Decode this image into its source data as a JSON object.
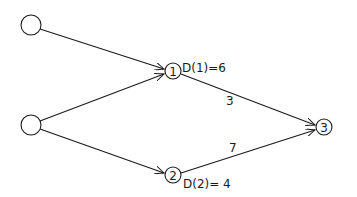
{
  "nodes": [
    {
      "id": "s1",
      "label": "",
      "x": 31,
      "y": 25,
      "r": 10
    },
    {
      "id": "s2",
      "label": "",
      "x": 31,
      "y": 125,
      "r": 10
    },
    {
      "id": "n1",
      "label": "1",
      "x": 173,
      "y": 71,
      "r": 8
    },
    {
      "id": "n2",
      "label": "2",
      "x": 173,
      "y": 175,
      "r": 8
    },
    {
      "id": "n3",
      "label": "3",
      "x": 324,
      "y": 127,
      "r": 8
    }
  ],
  "edges": [
    {
      "from": "s1",
      "to": "n1",
      "label": ""
    },
    {
      "from": "s2",
      "to": "n1",
      "label": ""
    },
    {
      "from": "s2",
      "to": "n2",
      "label": ""
    },
    {
      "from": "n1",
      "to": "n3",
      "label": "3"
    },
    {
      "from": "n2",
      "to": "n3",
      "label": "7"
    }
  ],
  "annotations": {
    "d1": "D(1)=6",
    "d2": "D(2)= 4",
    "w13": "3",
    "w23": "7"
  },
  "colors": {
    "stroke": "#1a1a1a",
    "background": "#ffffff"
  }
}
